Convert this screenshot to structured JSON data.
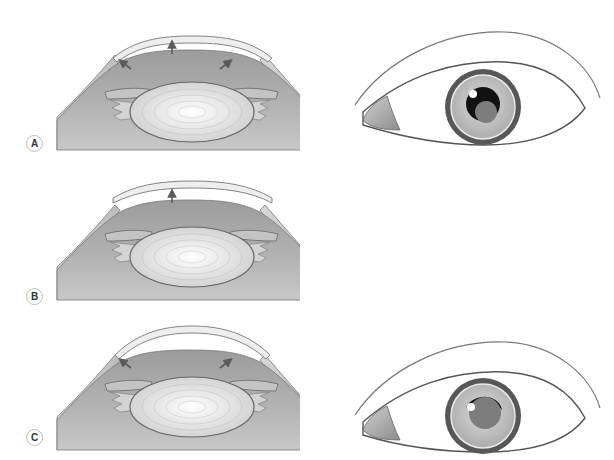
{
  "figure": {
    "panels": [
      {
        "id": "A",
        "label": "A",
        "arrows": [
          "up-left",
          "up",
          "up-right"
        ],
        "has_frontal_eye": true,
        "frontal_pupil": "dilated-dark-with-gray-center"
      },
      {
        "id": "B",
        "label": "B",
        "arrows": [
          "up"
        ],
        "has_frontal_eye": false
      },
      {
        "id": "C",
        "label": "C",
        "arrows": [
          "up-left",
          "up-right"
        ],
        "has_frontal_eye": true,
        "frontal_pupil": "gray-with-dark-crescent"
      }
    ],
    "colors": {
      "background": "#ffffff",
      "cornea_fill": "#ececec",
      "anterior_chamber": "#a9a9a9",
      "lens": "#e6e6e6",
      "iris": "#8a8a8a",
      "outline": "#666666",
      "arrow": "#5a5a5a",
      "pupil_dark": "#111111",
      "pupil_gray": "#7d7d7d"
    },
    "icons": {
      "arrow": "up-arrow-icon",
      "label_badge": "circle-letter-icon"
    }
  }
}
